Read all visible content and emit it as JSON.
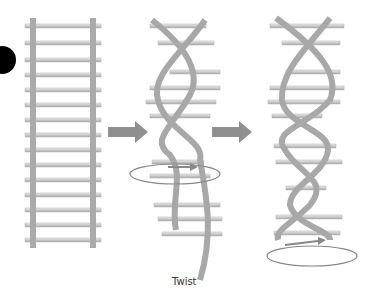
{
  "diagram": {
    "type": "DNA ladder twisting into double helix",
    "caption": "Twist",
    "colors": {
      "strand": "#a8a8a8",
      "rung": "#d4d4d4",
      "arrow": "#8f8f8f",
      "bullet": "#000000"
    },
    "stages": [
      "straight-ladder",
      "partially-twisted",
      "double-helix"
    ]
  }
}
